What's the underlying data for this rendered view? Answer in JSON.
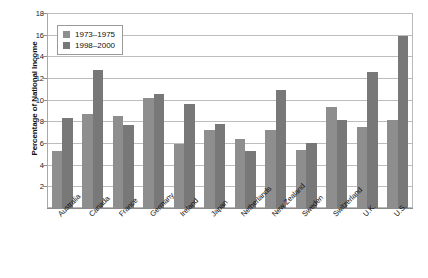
{
  "chart_data": {
    "type": "bar",
    "title": "",
    "xlabel": "",
    "ylabel": "Percentage of National Income",
    "ylim": [
      0,
      18
    ],
    "yticks": [
      2,
      4,
      6,
      8,
      10,
      12,
      14,
      16,
      18
    ],
    "grid": true,
    "legend_position": "top-left",
    "categories": [
      "Australia",
      "Canada",
      "France",
      "Germany",
      "Ireland",
      "Japan",
      "Netherlands",
      "New Zealand",
      "Sweden",
      "Switzerland",
      "U.K.",
      "U.S."
    ],
    "series": [
      {
        "name": "1973–1975",
        "color": "#8e8e8e",
        "values": [
          5.3,
          8.7,
          8.5,
          10.2,
          5.9,
          7.2,
          6.4,
          7.2,
          5.4,
          9.3,
          7.5,
          8.1
        ]
      },
      {
        "name": "1998–2000",
        "color": "#787878",
        "values": [
          8.3,
          12.7,
          7.7,
          10.5,
          9.6,
          7.8,
          5.3,
          10.9,
          6.0,
          8.1,
          12.6,
          15.9
        ]
      }
    ]
  },
  "colors": {
    "series_1973": "#8e8e8e",
    "series_1998": "#787878",
    "gridline": "#bdbdbd",
    "frame": "#b9b9b9",
    "text": "#111111"
  }
}
